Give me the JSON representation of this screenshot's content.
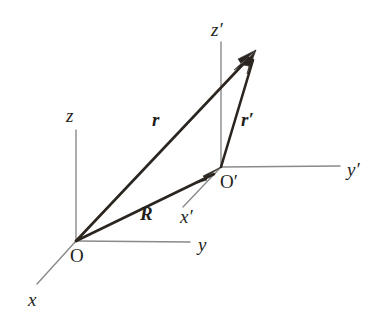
{
  "figure": {
    "background_color": "#ffffff",
    "width": 381,
    "height": 328
  },
  "colors": {
    "axis": "#8a8a88",
    "vector": "#2b2520",
    "text": "#241f1b",
    "background": "#ffffff"
  },
  "points": {
    "origin": {
      "label": "O",
      "x": 76,
      "y": 241
    },
    "origin_primed": {
      "label": "O′",
      "x": 221,
      "y": 167
    },
    "tip": {
      "label": "P",
      "x": 256,
      "y": 50
    }
  },
  "axes": [
    {
      "name": "x",
      "label": "x",
      "from": [
        76,
        241
      ],
      "to": [
        37,
        284
      ],
      "label_x": 28,
      "label_y": 306
    },
    {
      "name": "y",
      "label": "y",
      "from": [
        76,
        241
      ],
      "to": [
        190,
        242
      ],
      "label_x": 198,
      "label_y": 251
    },
    {
      "name": "z",
      "label": "z",
      "from": [
        76,
        241
      ],
      "to": [
        76,
        130
      ],
      "label_x": 66,
      "label_y": 122
    },
    {
      "name": "x-prime",
      "label": "x′",
      "from": [
        221,
        167
      ],
      "to": [
        183,
        207
      ],
      "label_x": 180,
      "label_y": 223
    },
    {
      "name": "y-prime",
      "label": "y′",
      "from": [
        221,
        167
      ],
      "to": [
        340,
        166
      ],
      "label_x": 347,
      "label_y": 176
    },
    {
      "name": "z-prime",
      "label": "z′",
      "from": [
        221,
        167
      ],
      "to": [
        221,
        42
      ],
      "label_x": 211,
      "label_y": 36
    }
  ],
  "vectors": [
    {
      "name": "r",
      "label": "r",
      "from": [
        76,
        241
      ],
      "to": [
        256,
        50
      ],
      "label_x": 152,
      "label_y": 126,
      "description": "position vector from O to P"
    },
    {
      "name": "R",
      "label": "R",
      "from": [
        76,
        241
      ],
      "to": [
        221,
        167
      ],
      "label_x": 140,
      "label_y": 220,
      "description": "displacement vector from O to O-prime"
    },
    {
      "name": "r-prime",
      "label": "r′",
      "from": [
        221,
        167
      ],
      "to": [
        256,
        50
      ],
      "label_x": 241,
      "label_y": 126,
      "description": "position vector from O-prime to P"
    }
  ]
}
